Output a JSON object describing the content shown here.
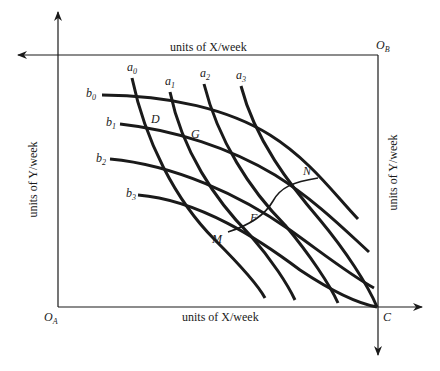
{
  "diagram": {
    "type": "edgeworth-box",
    "axes": {
      "top_label": "units of X/week",
      "bottom_label": "units of X/week",
      "left_label": "units of Y/week",
      "right_label": "units of Y/week"
    },
    "origins": {
      "bottom_left": {
        "main": "O",
        "sub": "A"
      },
      "top_right": {
        "main": "O",
        "sub": "B"
      },
      "bottom_right": {
        "main": "C",
        "sub": ""
      }
    },
    "a_curves": [
      {
        "main": "a",
        "sub": "0"
      },
      {
        "main": "a",
        "sub": "1"
      },
      {
        "main": "a",
        "sub": "2"
      },
      {
        "main": "a",
        "sub": "3"
      }
    ],
    "b_curves": [
      {
        "main": "b",
        "sub": "0"
      },
      {
        "main": "b",
        "sub": "1"
      },
      {
        "main": "b",
        "sub": "2"
      },
      {
        "main": "b",
        "sub": "3"
      }
    ],
    "points": [
      "D",
      "G",
      "F",
      "M",
      "N"
    ],
    "colors": {
      "line": "#1a1a1a",
      "background": "#ffffff"
    }
  }
}
